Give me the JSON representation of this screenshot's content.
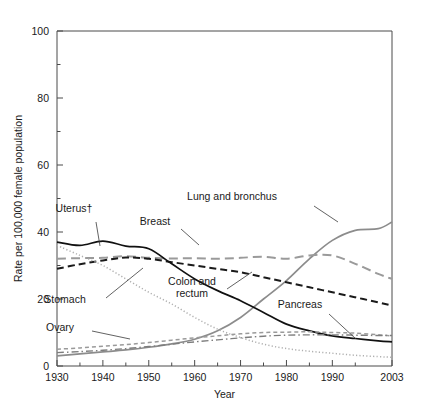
{
  "chart_data": {
    "type": "line",
    "title": "",
    "xlabel": "Year",
    "ylabel": "Rate per 100,000 female population",
    "xlim": [
      1930,
      2003
    ],
    "ylim": [
      0,
      100
    ],
    "grid": false,
    "legend_position": "inline-annotations",
    "x_ticks": [
      "1930",
      "1940",
      "1950",
      "1960",
      "1970",
      "1980",
      "1990",
      "2003"
    ],
    "x_tick_values": [
      1930,
      1940,
      1950,
      1960,
      1970,
      1980,
      1990,
      2003
    ],
    "y_ticks": [
      "0",
      "20",
      "40",
      "60",
      "80",
      "100"
    ],
    "y_tick_values": [
      0,
      20,
      40,
      60,
      80,
      100
    ],
    "x": [
      1930,
      1935,
      1940,
      1945,
      1950,
      1955,
      1960,
      1965,
      1970,
      1975,
      1980,
      1985,
      1990,
      1995,
      2000,
      2003
    ],
    "series": [
      {
        "name": "Lung and bronchus",
        "label": "Lung and bronchus",
        "color": "#8c8c8c",
        "style": "solid",
        "values": [
          3.0,
          3.6,
          4.2,
          4.8,
          5.6,
          6.6,
          8.0,
          10.5,
          14.5,
          20.0,
          25.5,
          32.0,
          37.5,
          40.5,
          41.0,
          43.0
        ]
      },
      {
        "name": "Breast",
        "label": "Breast",
        "color": "#9a9a9a",
        "style": "long-dash",
        "values": [
          32.0,
          32.2,
          32.3,
          32.8,
          32.3,
          32.1,
          32.2,
          32.0,
          32.3,
          32.6,
          32.0,
          33.0,
          33.0,
          30.5,
          27.5,
          26.0
        ]
      },
      {
        "name": "Colon and rectum",
        "label": "Colon and rectum",
        "color": "#1a1a1a",
        "style": "dash",
        "values": [
          29.0,
          30.4,
          31.5,
          32.4,
          32.0,
          31.0,
          30.0,
          29.0,
          28.0,
          26.5,
          25.0,
          23.5,
          22.0,
          20.5,
          19.0,
          18.0
        ]
      },
      {
        "name": "Uterus",
        "label": "Uterus†",
        "color": "#111111",
        "style": "solid",
        "values": [
          37.0,
          36.0,
          37.3,
          35.8,
          35.0,
          30.5,
          26.0,
          22.5,
          19.5,
          16.0,
          12.5,
          10.5,
          9.0,
          8.2,
          7.5,
          7.2
        ]
      },
      {
        "name": "Stomach",
        "label": "Stomach",
        "color": "#b0b0b0",
        "style": "dot",
        "values": [
          36.0,
          33.0,
          30.0,
          26.0,
          22.0,
          18.5,
          14.5,
          11.0,
          8.5,
          6.5,
          5.2,
          4.4,
          3.8,
          3.2,
          2.8,
          2.6
        ]
      },
      {
        "name": "Ovary",
        "label": "Ovary",
        "color": "#9a9a9a",
        "style": "short-dash",
        "values": [
          5.0,
          5.4,
          5.9,
          6.4,
          7.0,
          7.7,
          8.4,
          9.0,
          9.6,
          10.0,
          10.1,
          10.2,
          10.0,
          9.8,
          9.3,
          9.0
        ]
      },
      {
        "name": "Pancreas",
        "label": "Pancreas",
        "color": "#7d7d7d",
        "style": "dash-dot",
        "values": [
          4.0,
          4.3,
          4.7,
          5.2,
          5.8,
          6.5,
          7.2,
          7.8,
          8.4,
          8.9,
          9.2,
          9.3,
          9.3,
          9.2,
          9.1,
          9.1
        ]
      }
    ],
    "annotations": [
      {
        "label": "Uterus†",
        "x_px": 74,
        "y_px": 212
      },
      {
        "label": "Breast",
        "x_px": 155,
        "y_px": 225
      },
      {
        "label": "Lung and bronchus",
        "x_px": 232,
        "y_px": 200
      },
      {
        "label": "Colon and\nrectum",
        "x_px": 192,
        "y_px": 285
      },
      {
        "label": "Pancreas",
        "x_px": 300,
        "y_px": 308
      },
      {
        "label": "Stomach",
        "x_px": 65,
        "y_px": 303
      },
      {
        "label": "Ovary",
        "x_px": 60,
        "y_px": 331
      }
    ]
  }
}
